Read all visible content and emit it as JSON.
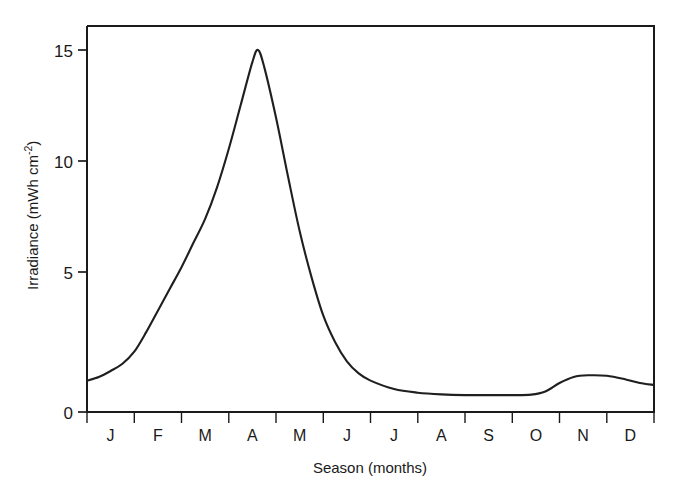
{
  "chart_data": {
    "type": "line",
    "title": "",
    "xlabel": "Season (months)",
    "ylabel": "Irradiance (mWh cm",
    "ylabel_sup": "-2",
    "ylabel_close": ")",
    "xlim": [
      0,
      12
    ],
    "ylim": [
      0,
      16
    ],
    "ytick_labels": [
      "0",
      "5",
      "10",
      "15"
    ],
    "ytick_values": [
      0,
      5,
      10,
      15
    ],
    "xtick_labels": [
      "J",
      "F",
      "M",
      "A",
      "M",
      "J",
      "J",
      "A",
      "S",
      "O",
      "N",
      "D"
    ],
    "xtick_values": [
      0.5,
      1.5,
      2.5,
      3.5,
      4.5,
      5.5,
      6.5,
      7.5,
      8.5,
      9.5,
      10.5,
      11.5
    ],
    "grid": false,
    "legend": false,
    "line_color": "#1f1f1f",
    "background": "#ffffff",
    "series": [
      {
        "name": "Irradiance",
        "x": [
          0.0,
          0.25,
          0.5,
          0.75,
          1.0,
          1.25,
          1.5,
          1.75,
          2.0,
          2.25,
          2.5,
          2.75,
          3.0,
          3.25,
          3.5,
          3.62,
          3.75,
          4.0,
          4.25,
          4.5,
          4.75,
          5.0,
          5.25,
          5.5,
          5.75,
          6.0,
          6.5,
          7.0,
          7.5,
          8.0,
          8.5,
          9.0,
          9.4,
          9.7,
          10.0,
          10.3,
          10.6,
          11.0,
          11.4,
          11.7,
          12.0
        ],
        "y": [
          1.3,
          1.45,
          1.7,
          2.0,
          2.5,
          3.3,
          4.2,
          5.1,
          6.0,
          7.0,
          8.0,
          9.3,
          10.9,
          12.7,
          14.5,
          15.0,
          14.3,
          12.2,
          9.8,
          7.5,
          5.6,
          4.0,
          2.9,
          2.1,
          1.6,
          1.3,
          0.95,
          0.8,
          0.73,
          0.7,
          0.7,
          0.7,
          0.72,
          0.85,
          1.2,
          1.45,
          1.52,
          1.5,
          1.35,
          1.2,
          1.12
        ]
      }
    ],
    "annotations": {
      "peak_month": "April",
      "peak_value": 15.0,
      "minimum_value": 0.7,
      "secondary_peak_month": "November",
      "secondary_peak_value": 1.5
    }
  },
  "axes": {
    "y_axis_title_full": "Irradiance (mWh cm-2)",
    "x_axis_title": "Season (months)"
  }
}
